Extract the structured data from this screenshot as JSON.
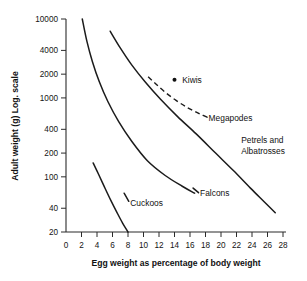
{
  "chart_data": {
    "type": "line",
    "title": "",
    "xlabel": "Egg weight as percentage of body weight",
    "ylabel": "Adult weight (g) Log. scale",
    "xlim": [
      0,
      28
    ],
    "ylim": [
      20,
      10000
    ],
    "yscale": "log",
    "grid": false,
    "legend_position": "inline-annotations",
    "xticks": [
      0,
      2,
      4,
      6,
      8,
      10,
      12,
      14,
      16,
      18,
      20,
      22,
      24,
      26,
      28
    ],
    "xtick_labels": [
      "0",
      "2",
      "4",
      "6",
      "8",
      "10",
      "12",
      "14",
      "16",
      "18",
      "20",
      "22",
      "24",
      "26",
      "28"
    ],
    "yticks": [
      20,
      40,
      100,
      200,
      400,
      1000,
      2000,
      4000,
      10000
    ],
    "ytick_labels": [
      "20",
      "40",
      "100",
      "200",
      "400",
      "1000",
      "2000",
      "4000",
      "10000"
    ],
    "series": [
      {
        "name": "Cuckoos",
        "style": "solid",
        "label": "Cuckoos",
        "points": [
          [
            3.5,
            150
          ],
          [
            4.2,
            108
          ],
          [
            5.0,
            73
          ],
          [
            5.8,
            50
          ],
          [
            6.6,
            35
          ],
          [
            7.3,
            26
          ],
          [
            8.0,
            20
          ]
        ]
      },
      {
        "name": "Falcons",
        "style": "solid",
        "label": "Falcons",
        "points": [
          [
            2.1,
            10000
          ],
          [
            2.7,
            5200
          ],
          [
            3.4,
            2900
          ],
          [
            4.3,
            1600
          ],
          [
            5.4,
            900
          ],
          [
            6.8,
            500
          ],
          [
            8.5,
            280
          ],
          [
            10.5,
            160
          ],
          [
            12.8,
            104
          ],
          [
            15.0,
            76
          ],
          [
            16.6,
            62
          ]
        ]
      },
      {
        "name": "Petrels and Albatrosses",
        "style": "solid",
        "label": "Petrels and Albatrosses",
        "points": [
          [
            5.7,
            7000
          ],
          [
            7.0,
            4300
          ],
          [
            8.5,
            2600
          ],
          [
            10.2,
            1600
          ],
          [
            12.2,
            960
          ],
          [
            14.4,
            580
          ],
          [
            16.8,
            350
          ],
          [
            19.3,
            200
          ],
          [
            21.6,
            120
          ],
          [
            23.8,
            72
          ],
          [
            25.6,
            48
          ],
          [
            27.0,
            35
          ]
        ]
      },
      {
        "name": "Megapodes",
        "style": "dashed",
        "label": "Megapodes",
        "points": [
          [
            10.6,
            1850
          ],
          [
            11.6,
            1500
          ],
          [
            12.8,
            1180
          ],
          [
            14.2,
            930
          ],
          [
            15.6,
            760
          ],
          [
            16.8,
            660
          ],
          [
            17.6,
            600
          ]
        ]
      }
    ],
    "points": [
      {
        "name": "Kiwis",
        "label": "Kiwis",
        "x": 14.0,
        "y": 1700,
        "marker": "dot"
      }
    ],
    "annotations": [
      {
        "name": "cuckoos-label",
        "text": "Cuckoos",
        "x": 8.3,
        "y": 46
      },
      {
        "name": "falcons-label",
        "text": "Falcons",
        "x": 17.3,
        "y": 62
      },
      {
        "name": "megapodes-label",
        "text": "Megapodes",
        "x": 18.4,
        "y": 560
      },
      {
        "name": "petrels-label-line1",
        "text": "Petrels and",
        "x": 22.6,
        "y": 290
      },
      {
        "name": "petrels-label-line2",
        "text": "Albatrosses",
        "x": 22.6,
        "y": 215
      },
      {
        "name": "kiwis-label",
        "text": "Kiwis",
        "x": 15.0,
        "y": 1700
      }
    ],
    "colors": {
      "curve": "#1b1b1b",
      "axis": "#2b2b2b",
      "text": "#111111",
      "background": "#ffffff"
    }
  }
}
